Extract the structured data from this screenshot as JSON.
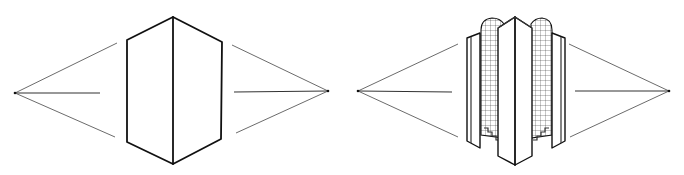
{
  "figure": {
    "panels": [
      {
        "id": "simple-box",
        "label": "Two-point perspective box",
        "vanishing_points": {
          "left": [
            15,
            93
          ],
          "right": [
            328,
            91
          ]
        }
      },
      {
        "id": "tower",
        "label": "Two-point perspective tower with gridded cylindrical bays",
        "vanishing_points": {
          "left": [
            358,
            91
          ],
          "right": [
            669,
            91
          ]
        }
      }
    ],
    "colors": {
      "ink": "#111111",
      "guide": "#5a5a5a",
      "background": "#ffffff"
    }
  }
}
